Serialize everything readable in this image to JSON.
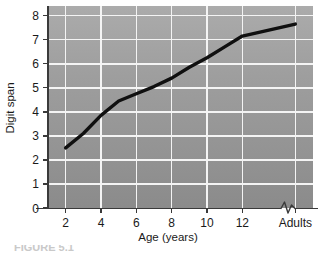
{
  "figure": {
    "caption_partial": "FIGURE 5.1"
  },
  "chart_data": {
    "type": "line",
    "title": "",
    "xlabel": "Age (years)",
    "ylabel": "Digit span",
    "x_tick_labels": [
      "2",
      "4",
      "6",
      "8",
      "10",
      "12",
      "Adults"
    ],
    "x_tick_values": [
      2,
      4,
      6,
      8,
      10,
      12,
      15
    ],
    "y_tick_labels": [
      "0",
      "1",
      "2",
      "3",
      "4",
      "5",
      "6",
      "7",
      "8"
    ],
    "ylim": [
      0,
      8.4
    ],
    "xlim": [
      1,
      16
    ],
    "grid": true,
    "legend": null,
    "axis_break": {
      "present": true,
      "axis": "x",
      "between_labels": [
        "12",
        "Adults"
      ]
    },
    "series": [
      {
        "name": "Digit span by age",
        "points": [
          {
            "x": 2,
            "label": "2",
            "y": 2.5
          },
          {
            "x": 3,
            "label": "3",
            "y": 3.1
          },
          {
            "x": 4,
            "label": "4",
            "y": 3.85
          },
          {
            "x": 5,
            "label": "5",
            "y": 4.45
          },
          {
            "x": 6,
            "label": "6",
            "y": 4.75
          },
          {
            "x": 7,
            "label": "7",
            "y": 5.05
          },
          {
            "x": 8,
            "label": "8",
            "y": 5.4
          },
          {
            "x": 9,
            "label": "9",
            "y": 5.85
          },
          {
            "x": 10,
            "label": "10",
            "y": 6.25
          },
          {
            "x": 11,
            "label": "11",
            "y": 6.7
          },
          {
            "x": 12,
            "label": "12",
            "y": 7.15
          },
          {
            "x": 15,
            "label": "Adults",
            "y": 7.65
          }
        ]
      }
    ],
    "colors": {
      "line": "#101010",
      "grid": "#f2f2f2",
      "axis": "#3a3a3a",
      "plot_bg_top": "#a6a6a6",
      "plot_bg_bottom": "#8f8f8f",
      "text": "#1a1a1a"
    }
  }
}
